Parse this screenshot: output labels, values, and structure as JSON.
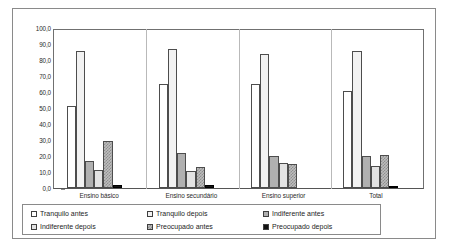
{
  "chart_data": {
    "type": "bar",
    "title": "",
    "subtitle": "",
    "xlabel": "",
    "ylabel": "",
    "ylim": [
      0,
      100
    ],
    "yticks": [
      "0,0",
      "10,0",
      "20,0",
      "30,0",
      "40,0",
      "50,0",
      "60,0",
      "70,0",
      "80,0",
      "90,0",
      "100,0"
    ],
    "ytick_values": [
      0,
      10,
      20,
      30,
      40,
      50,
      60,
      70,
      80,
      90,
      100
    ],
    "grid": false,
    "legend_position": "bottom",
    "categories": [
      "Ensino básico",
      "Ensino secundário",
      "Ensino superior",
      "Total"
    ],
    "series": [
      {
        "name": "Tranquilo antes",
        "fill": "f-tranquilo-antes",
        "color": "#ffffff",
        "values": [
          52.0,
          66.0,
          66.0,
          61.5
        ]
      },
      {
        "name": "Tranquilo depois",
        "fill": "f-tranquilo-depois",
        "color": "#f2f2f2",
        "values": [
          87.0,
          88.0,
          85.0,
          86.5
        ]
      },
      {
        "name": "Indiferente antes",
        "fill": "f-indiferente-antes",
        "color": "#b0b0b0",
        "values": [
          17.0,
          22.0,
          20.5,
          20.0
        ]
      },
      {
        "name": "Indiferente depois",
        "fill": "f-indiferente-depois",
        "color": "#e3e3e3",
        "values": [
          11.5,
          11.0,
          16.0,
          14.0
        ]
      },
      {
        "name": "Preocupado antes",
        "fill": "f-preocupado-antes",
        "color": "#bdbdbd",
        "values": [
          30.0,
          13.0,
          15.0,
          21.0
        ]
      },
      {
        "name": "Preocupado depois",
        "fill": "f-preocupado-depois",
        "color": "#131313",
        "values": [
          2.0,
          2.0,
          0.0,
          1.5
        ]
      }
    ]
  },
  "legend": {
    "items": [
      {
        "label": "Tranquilo antes",
        "fill": "f-tranquilo-antes"
      },
      {
        "label": "Tranquilo depois",
        "fill": "f-tranquilo-depois"
      },
      {
        "label": "Indiferente antes",
        "fill": "f-indiferente-antes"
      },
      {
        "label": "Indiferente depois",
        "fill": "f-indiferente-depois"
      },
      {
        "label": "Preocupado antes",
        "fill": "f-preocupado-antes"
      },
      {
        "label": "Preocupado depois",
        "fill": "f-preocupado-depois"
      }
    ]
  }
}
